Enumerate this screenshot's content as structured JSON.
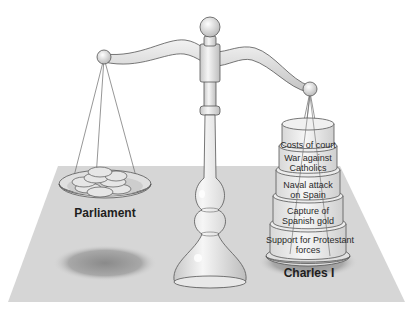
{
  "figure": {
    "colors": {
      "background": "#ffffff",
      "floor": "#d6d6d6",
      "metal": "#e4e4e4",
      "outline": "#555555",
      "shadow": "#9a9a9a"
    }
  },
  "left_pan": {
    "label": "Parliament",
    "contents": "coins"
  },
  "right_pan": {
    "label": "Charles I",
    "weights": [
      {
        "label": "Costs of court"
      },
      {
        "label": "War against Catholics"
      },
      {
        "label": "Naval attack on Spain"
      },
      {
        "label": "Capture of Spanish gold"
      },
      {
        "label": "Support for Protestant forces"
      }
    ]
  },
  "display_lines": {
    "w0": "Costs of court",
    "w1a": "War against",
    "w1b": "Catholics",
    "w2a": "Naval attack",
    "w2b": "on Spain",
    "w3a": "Capture of",
    "w3b": "Spanish gold",
    "w4a": "Support for Protestant",
    "w4b": "forces"
  }
}
